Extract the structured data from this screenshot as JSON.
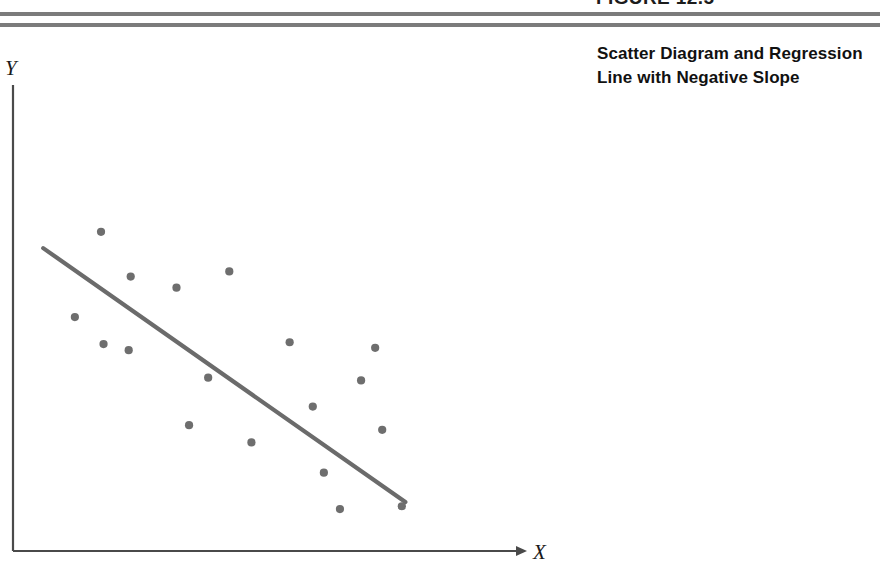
{
  "figure": {
    "number_label": "FIGURE 12.5",
    "caption": "Scatter Diagram and Regression Line with Negative Slope"
  },
  "colors": {
    "rule": "#7b7b7b",
    "axis": "#4a4a4a",
    "point": "#6e6e6e",
    "regression_line": "#6b6b6b",
    "caption_text": "#111111"
  },
  "chart_data": {
    "type": "scatter",
    "title": "Scatter Diagram and Regression Line with Negative Slope",
    "xlabel": "X",
    "ylabel": "Y",
    "grid": false,
    "legend": false,
    "axis_style": "arrow-terminated L-shaped axes, no tick marks, no tick labels",
    "xlim": [
      0,
      100
    ],
    "ylim": [
      0,
      100
    ],
    "points": [
      {
        "x": 17.5,
        "y": 68.5
      },
      {
        "x": 12.3,
        "y": 50.2
      },
      {
        "x": 23.4,
        "y": 58.9
      },
      {
        "x": 18.0,
        "y": 44.4
      },
      {
        "x": 32.5,
        "y": 56.5
      },
      {
        "x": 43.0,
        "y": 60.0
      },
      {
        "x": 23.0,
        "y": 43.1
      },
      {
        "x": 55.0,
        "y": 44.8
      },
      {
        "x": 72.0,
        "y": 43.6
      },
      {
        "x": 38.8,
        "y": 37.2
      },
      {
        "x": 69.2,
        "y": 36.6
      },
      {
        "x": 59.6,
        "y": 31.0
      },
      {
        "x": 35.0,
        "y": 27.0
      },
      {
        "x": 73.4,
        "y": 26.0
      },
      {
        "x": 47.4,
        "y": 23.3
      },
      {
        "x": 61.8,
        "y": 16.8
      },
      {
        "x": 65.0,
        "y": 9.0
      },
      {
        "x": 77.3,
        "y": 9.6
      }
    ],
    "regression_line": {
      "slope_sign": "negative",
      "x_start": 6.0,
      "y_start": 65.0,
      "x_end": 78.0,
      "y_end": 10.5
    }
  }
}
